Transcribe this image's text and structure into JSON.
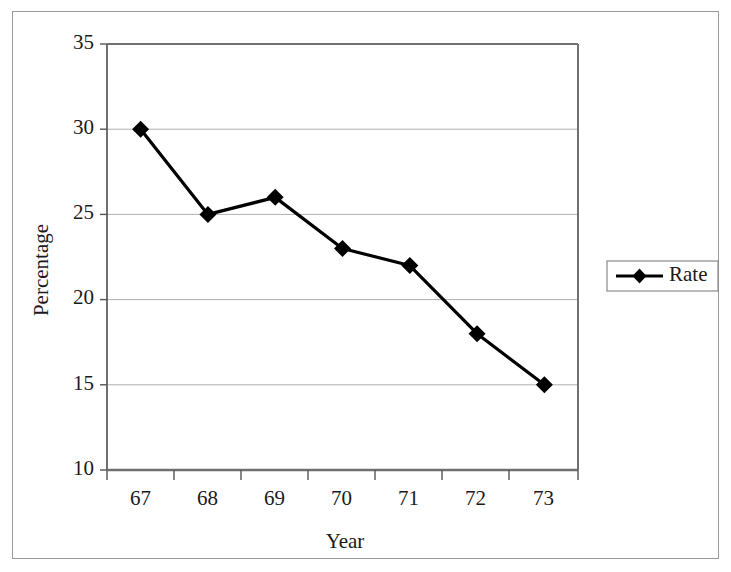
{
  "chart_data": {
    "type": "line",
    "title": "",
    "subtitle": "",
    "xlabel": "Year",
    "ylabel": "Percentage",
    "categories": [
      "67",
      "68",
      "69",
      "70",
      "71",
      "72",
      "73"
    ],
    "series": [
      {
        "name": "Rate",
        "values": [
          30,
          25,
          26,
          23,
          22,
          18,
          15
        ],
        "marker": "diamond",
        "color": "#000000"
      }
    ],
    "ylim": [
      10,
      35
    ],
    "ytick_labels": [
      "35",
      "30",
      "25",
      "20",
      "15",
      "10"
    ],
    "ytick_values": [
      35,
      30,
      25,
      20,
      15,
      10
    ],
    "grid": "horizontal",
    "grid_color": "#808080",
    "legend_position": "right",
    "legend_entries": [
      "Rate"
    ],
    "plot_border_color": "#808080",
    "background_color": "#ffffff"
  },
  "axes": {
    "y_title": "Percentage",
    "x_title": "Year"
  },
  "legend": {
    "items": [
      {
        "label": "Rate",
        "marker": "diamond-marker",
        "color": "#000000"
      }
    ]
  }
}
